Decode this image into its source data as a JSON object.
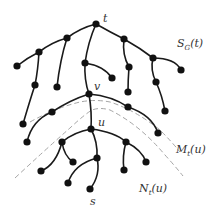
{
  "diagram": {
    "type": "tree",
    "colors": {
      "edge": "#1a1a1a",
      "node": "#111111",
      "dashed": "#9a9a9a",
      "label": "#333333"
    },
    "labels": {
      "t": "t",
      "v": "v",
      "u": "u",
      "s": "s",
      "region_top": "S_G(t)",
      "region_top_main": "S",
      "region_top_sub": "G",
      "region_top_arg": "(t)",
      "region_middle_main": "M",
      "region_middle_sub": "t",
      "region_middle_arg": "(u)",
      "region_bottom_main": "N",
      "region_bottom_sub": "t",
      "region_bottom_arg": "(u)"
    },
    "nodes": [
      {
        "id": "t",
        "x": 96,
        "y": 24
      },
      {
        "id": "a1",
        "x": 67,
        "y": 38
      },
      {
        "id": "a2",
        "x": 39,
        "y": 52
      },
      {
        "id": "a3",
        "x": 17,
        "y": 66
      },
      {
        "id": "a4",
        "x": 35,
        "y": 85
      },
      {
        "id": "a5",
        "x": 57,
        "y": 87
      },
      {
        "id": "b1",
        "x": 85,
        "y": 63
      },
      {
        "id": "b2",
        "x": 112,
        "y": 78
      },
      {
        "id": "v",
        "x": 89,
        "y": 94
      },
      {
        "id": "c1",
        "x": 124,
        "y": 39
      },
      {
        "id": "c2",
        "x": 129,
        "y": 67
      },
      {
        "id": "c3",
        "x": 128,
        "y": 92
      },
      {
        "id": "d1",
        "x": 153,
        "y": 58
      },
      {
        "id": "d2",
        "x": 181,
        "y": 70
      },
      {
        "id": "d3",
        "x": 156,
        "y": 82
      },
      {
        "id": "d4",
        "x": 165,
        "y": 111
      },
      {
        "id": "e1",
        "x": 52,
        "y": 112
      },
      {
        "id": "e2",
        "x": 23,
        "y": 124
      },
      {
        "id": "e3",
        "x": 27,
        "y": 142
      },
      {
        "id": "f1",
        "x": 128,
        "y": 107
      },
      {
        "id": "f2",
        "x": 158,
        "y": 133
      },
      {
        "id": "u",
        "x": 91,
        "y": 129
      },
      {
        "id": "g1",
        "x": 62,
        "y": 142
      },
      {
        "id": "g2",
        "x": 73,
        "y": 162
      },
      {
        "id": "g3",
        "x": 41,
        "y": 171
      },
      {
        "id": "h1",
        "x": 97,
        "y": 158
      },
      {
        "id": "h2",
        "x": 68,
        "y": 183
      },
      {
        "id": "s",
        "x": 90,
        "y": 189
      },
      {
        "id": "i1",
        "x": 126,
        "y": 142
      },
      {
        "id": "i2",
        "x": 146,
        "y": 162
      },
      {
        "id": "i3",
        "x": 124,
        "y": 170
      }
    ]
  }
}
